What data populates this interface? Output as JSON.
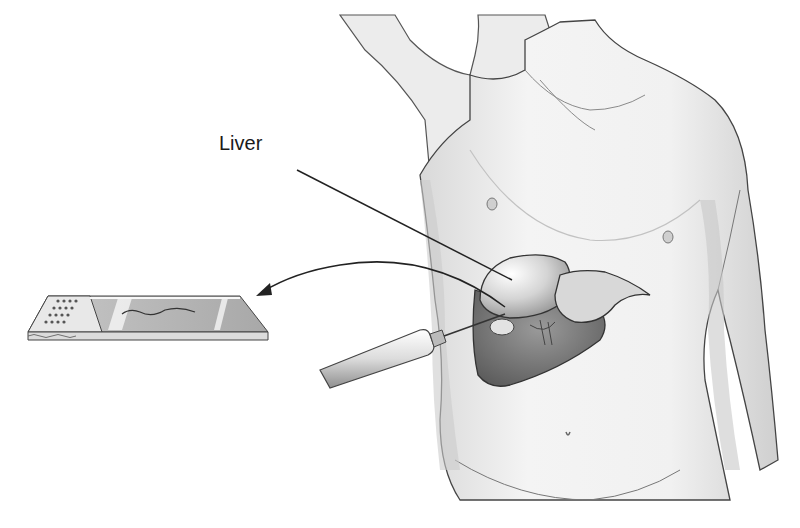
{
  "diagram": {
    "type": "medical-illustration",
    "labels": [
      {
        "text": "Liver",
        "x": 219,
        "y": 145,
        "points_to": "liver"
      }
    ],
    "components": [
      {
        "name": "torso",
        "description": "front view of upper body with raised right arm"
      },
      {
        "name": "liver",
        "description": "exposed liver within cutaway of right upper abdomen"
      },
      {
        "name": "biopsy-needle",
        "description": "syringe with needle inserted into liver"
      },
      {
        "name": "transfer-arrow",
        "description": "curved arrow from liver to slide"
      },
      {
        "name": "microscope-slide",
        "description": "glass slide with tissue sample strip"
      }
    ],
    "colors": {
      "background": "#ffffff",
      "line": "#222222",
      "skin_shade": "#e6e6e6",
      "organ_shade": "#bdbdbd",
      "dark_shade": "#6e6e6e"
    }
  }
}
